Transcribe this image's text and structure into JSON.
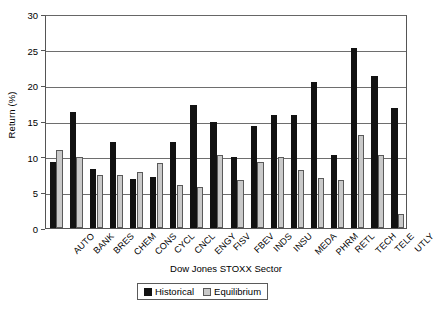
{
  "chart_data": {
    "type": "bar",
    "title": "",
    "xlabel": "Dow Jones STOXX Sector",
    "ylabel": "Return (%)",
    "ylim": [
      0,
      30
    ],
    "yticks": [
      0,
      5,
      10,
      15,
      20,
      25,
      30
    ],
    "grid": "horizontal",
    "legend_position": "bottom-center",
    "categories": [
      "AUTO",
      "BANK",
      "BRES",
      "CHEM",
      "CONS",
      "CYCL",
      "CNCL",
      "ENGY",
      "FISV",
      "FBEV",
      "INDS",
      "INSU",
      "MEDA",
      "PHRM",
      "RETL",
      "TECH",
      "TELE",
      "UTLY"
    ],
    "series": [
      {
        "name": "Historical",
        "color": "#121212",
        "values": [
          9.3,
          16.3,
          8.3,
          12.1,
          6.9,
          7.1,
          12.0,
          17.2,
          14.8,
          10.0,
          14.3,
          15.8,
          15.8,
          20.5,
          10.3,
          25.3,
          21.3,
          16.8
        ]
      },
      {
        "name": "Equilibrium",
        "color": "#c9c9c9",
        "values": [
          11.0,
          9.9,
          7.5,
          7.4,
          7.9,
          9.1,
          6.1,
          5.8,
          10.3,
          6.8,
          9.2,
          9.9,
          8.2,
          7.0,
          6.8,
          13.1,
          10.3,
          1.9
        ]
      }
    ]
  },
  "legend": {
    "entries": [
      {
        "label": "Historical"
      },
      {
        "label": "Equilibrium"
      }
    ]
  }
}
